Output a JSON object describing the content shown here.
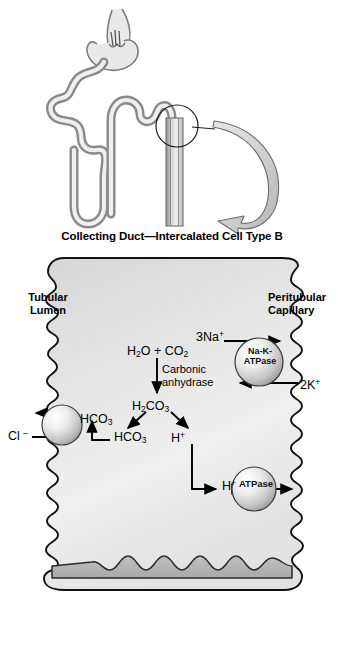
{
  "figure": {
    "title": "Collecting Duct—Intercalated Cell Type B",
    "compartments": {
      "left_label_line1": "Tubular",
      "left_label_line2": "Lumen",
      "right_label_line1": "Peritubular",
      "right_label_line2": "Capillary"
    },
    "reaction": {
      "substrates": "H2O + CO2",
      "enzyme_line1": "Carbonic",
      "enzyme_line2": "anhydrase",
      "intermediate": "H2CO3",
      "product_base": "HCO3",
      "product_acid": "H+"
    },
    "transporters": [
      {
        "name": "anion-exchanger",
        "label": "",
        "membrane": "apical",
        "species_in": "Cl -",
        "species_out": "HCO3"
      },
      {
        "name": "sodium-potassium-atpase",
        "label_line1": "Na-K-",
        "label_line2": "ATPase",
        "membrane": "basolateral",
        "species_out": "3Na+",
        "species_in": "2K+"
      },
      {
        "name": "proton-atpase",
        "label": "ATPase",
        "membrane": "basolateral",
        "species": "H+"
      }
    ],
    "labels": {
      "lumen_hco3": "HCO3",
      "cytosol_hco3": "HCO3",
      "cytosol_h": "H+",
      "secreted_h": "H+",
      "chloride": "Cl -",
      "sodium": "3Na+",
      "potassium": "2K+"
    },
    "nephron_schematic": {
      "present": true,
      "callout": "circle-with-curved-arrow",
      "structures": [
        "glomerulus",
        "proximal-convoluted-tubule",
        "loop-of-henle",
        "distal-convoluted-tubule",
        "collecting-duct"
      ]
    },
    "colors": {
      "cytoplasm_light": "#f2f2f2",
      "cytoplasm_mid": "#d9d9d9",
      "membrane_outline": "#1a1a1a",
      "tubule_wall": "#9a9a9a",
      "tubule_fill": "#e8e8e8",
      "arrow_fill": "#c9c9c9",
      "sphere_light": "#fbfbfb",
      "sphere_dark": "#9e9e9e"
    }
  }
}
